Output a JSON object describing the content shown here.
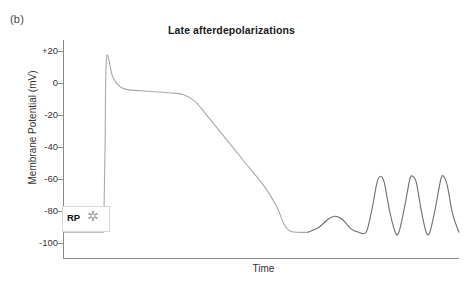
{
  "panel": {
    "label": "(b)"
  },
  "title": {
    "text": "Late afterdepolarizations"
  },
  "axes": {
    "ylabel": "Membrane Potential (mV)",
    "xlabel": "Time",
    "yticks": [
      "+20",
      "0",
      "-20",
      "-40",
      "-60",
      "-80",
      "-100"
    ]
  },
  "annotations": {
    "rp_label": "RP",
    "rp_star": "✲"
  },
  "colors": {
    "axis": "#8a8a8a",
    "trace_main": "#a9a9a9",
    "trace_osc": "#6e6e6e",
    "text": "#333333",
    "star": "#9a9a9a"
  },
  "chart_data": {
    "type": "line",
    "title": "Late afterdepolarizations",
    "xlabel": "Time",
    "ylabel": "Membrane Potential (mV)",
    "xlim": [
      0,
      100
    ],
    "ylim": [
      -100,
      20
    ],
    "yticks": [
      20,
      0,
      -20,
      -40,
      -60,
      -80,
      -100
    ],
    "grid": false,
    "legend": null,
    "annotations": [
      {
        "text": "RP",
        "value_mV": -93,
        "meaning": "resting potential"
      },
      {
        "text": "✲",
        "meaning": "stimulus marker"
      }
    ],
    "series": [
      {
        "name": "Action potential with late afterdepolarizations",
        "resting_potential_mV": -93,
        "peak_overshoot_mV": 16,
        "plateau_mV": -6,
        "points": [
          {
            "t": 0.0,
            "mV": -93
          },
          {
            "t": 11.0,
            "mV": -93
          },
          {
            "t": 11.4,
            "mV": -40
          },
          {
            "t": 11.8,
            "mV": 16
          },
          {
            "t": 13.5,
            "mV": 4
          },
          {
            "t": 15.5,
            "mV": -2
          },
          {
            "t": 18.0,
            "mV": -4
          },
          {
            "t": 24.0,
            "mV": -5
          },
          {
            "t": 30.0,
            "mV": -6
          },
          {
            "t": 33.0,
            "mV": -7
          },
          {
            "t": 36.0,
            "mV": -11
          },
          {
            "t": 39.0,
            "mV": -19
          },
          {
            "t": 44.0,
            "mV": -33
          },
          {
            "t": 50.0,
            "mV": -50
          },
          {
            "t": 55.0,
            "mV": -64
          },
          {
            "t": 58.5,
            "mV": -77
          },
          {
            "t": 60.5,
            "mV": -88
          },
          {
            "t": 62.0,
            "mV": -92
          },
          {
            "t": 64.0,
            "mV": -93
          },
          {
            "t": 67.0,
            "mV": -93
          },
          {
            "t": 70.0,
            "mV": -90
          },
          {
            "t": 72.5,
            "mV": -85
          },
          {
            "t": 74.5,
            "mV": -83
          },
          {
            "t": 76.5,
            "mV": -85
          },
          {
            "t": 79.0,
            "mV": -91
          },
          {
            "t": 81.0,
            "mV": -93
          },
          {
            "t": 83.0,
            "mV": -93
          },
          {
            "t": 84.5,
            "mV": -80
          },
          {
            "t": 86.0,
            "mV": -62
          },
          {
            "t": 87.0,
            "mV": -58
          },
          {
            "t": 88.0,
            "mV": -62
          },
          {
            "t": 89.5,
            "mV": -80
          },
          {
            "t": 91.0,
            "mV": -93
          },
          {
            "t": 92.0,
            "mV": -93
          },
          {
            "t": 93.5,
            "mV": -78
          },
          {
            "t": 95.0,
            "mV": -60
          },
          {
            "t": 95.8,
            "mV": -58
          },
          {
            "t": 96.8,
            "mV": -62
          },
          {
            "t": 98.2,
            "mV": -80
          },
          {
            "t": 99.5,
            "mV": -93
          },
          {
            "t": 100.5,
            "mV": -93
          },
          {
            "t": 102.0,
            "mV": -78
          },
          {
            "t": 103.5,
            "mV": -60
          },
          {
            "t": 104.3,
            "mV": -58
          },
          {
            "t": 105.3,
            "mV": -64
          },
          {
            "t": 106.8,
            "mV": -82
          },
          {
            "t": 108.5,
            "mV": -93
          }
        ],
        "afterdepolarization_peaks_mV": [
          -83,
          -58,
          -58,
          -58
        ]
      }
    ]
  }
}
